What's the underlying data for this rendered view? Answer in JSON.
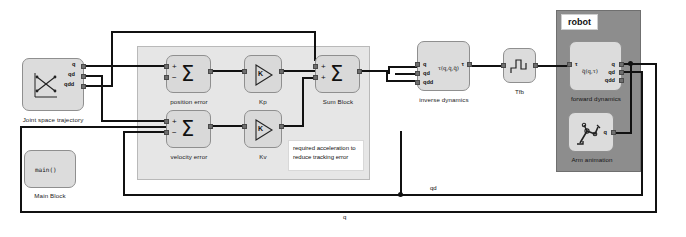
{
  "diagram": {
    "colors": {
      "wire": "#111111",
      "block_fill": "#dcdcdc",
      "control_panel_fill": "#e6e6e6",
      "robot_panel_fill": "#8d8d8d",
      "port": "#6e6e6e",
      "background": "#ffffff"
    }
  },
  "subsystems": {
    "robot": {
      "label": "robot"
    }
  },
  "blocks": {
    "trajectory": {
      "caption": "Joint space trajectory",
      "icon": "trajectory-crossing-icon",
      "outputs": [
        "q",
        "qd",
        "qdd"
      ]
    },
    "main": {
      "caption": "Main Block",
      "text": "main()"
    },
    "position_error": {
      "caption": "position error",
      "icon": "sum-sigma-icon",
      "signs": [
        "+",
        "−"
      ]
    },
    "velocity_error": {
      "caption": "velocity error",
      "icon": "sum-sigma-icon",
      "signs": [
        "+",
        "−"
      ]
    },
    "kp": {
      "caption": "Kp",
      "icon": "gain-triangle-icon",
      "text": "K"
    },
    "kv": {
      "caption": "Kv",
      "icon": "gain-triangle-icon",
      "text": "K"
    },
    "sum_block": {
      "caption": "Sum Block",
      "icon": "sum-sigma-icon",
      "signs": [
        "+",
        "+"
      ]
    },
    "inverse_dynamics": {
      "caption": "inverse dynamics",
      "text": "τ(q,q̇,q̈)",
      "inputs": [
        "q",
        "qd",
        "qdd"
      ],
      "outputs": [
        "τ"
      ]
    },
    "tfb": {
      "caption": "Tfb",
      "icon": "step-waveform-icon"
    },
    "forward_dynamics": {
      "caption": "forward dynamics",
      "text": "q̈(q,τ)",
      "inputs": [
        "τ"
      ],
      "outputs": [
        "q",
        "qd",
        "qdd"
      ]
    },
    "arm_animation": {
      "caption": "Arm animation",
      "icon": "robot-arm-icon",
      "inputs": [
        "q"
      ]
    }
  },
  "annotations": {
    "tracking_note": "required acceleration to reduce tracking error"
  },
  "signal_labels": {
    "qd_feedback": "qd",
    "q_feedback": "q"
  }
}
